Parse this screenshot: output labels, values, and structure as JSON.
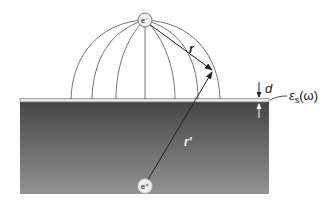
{
  "diagram": {
    "labels": {
      "r": "r",
      "r_prime": "r′",
      "d": "d",
      "epsilon_symbol": "ε",
      "epsilon_sub": "s",
      "epsilon_arg": "(ω)"
    },
    "charges": {
      "electron": "e⁻",
      "image": "e⁺"
    },
    "colors": {
      "substrate_top": "#4a4a4a",
      "substrate_bottom": "#8e8e8e",
      "layer": "#e2e2e2",
      "lines": "#333333"
    }
  }
}
